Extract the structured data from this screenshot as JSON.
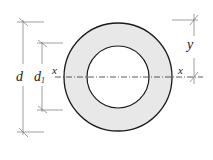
{
  "diagram": {
    "type": "annular cross-section",
    "labels": {
      "outer_diameter": "d",
      "inner_diameter_base": "d",
      "inner_diameter_sub": "1",
      "axis_left": "x",
      "axis_right": "x",
      "distance": "y"
    },
    "colors": {
      "ring_fill": "#e8e8e8",
      "outline": "#1a1a1a",
      "dimension_line": "#777777",
      "background": "#ffffff"
    },
    "geometry": {
      "center": [
        118,
        77
      ],
      "outer_radius": 54,
      "inner_radius": 31
    }
  }
}
